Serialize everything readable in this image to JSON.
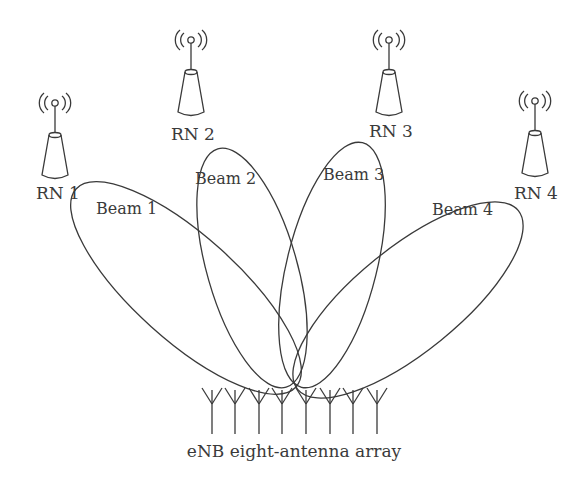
{
  "diagram": {
    "type": "relay-node beamforming illustration",
    "stroke_color": "#3a3a3a",
    "background": "#ffffff",
    "relay_nodes": [
      {
        "label": "RN 1",
        "icon": "relay-tower-icon"
      },
      {
        "label": "RN 2",
        "icon": "relay-tower-icon"
      },
      {
        "label": "RN 3",
        "icon": "relay-tower-icon"
      },
      {
        "label": "RN 4",
        "icon": "relay-tower-icon"
      }
    ],
    "beams": [
      {
        "label": "Beam 1"
      },
      {
        "label": "Beam 2"
      },
      {
        "label": "Beam 3"
      },
      {
        "label": "Beam 4"
      }
    ],
    "antenna_array": {
      "label": "eNB eight-antenna array",
      "antenna_count": 8,
      "icon": "antenna-element-icon"
    }
  }
}
